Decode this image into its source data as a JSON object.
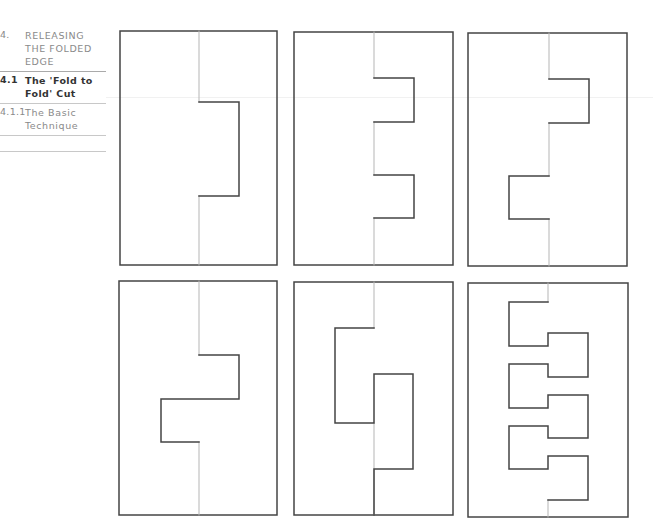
{
  "sidebar": {
    "items": [
      {
        "number": "4.",
        "label": "RELEASING THE FOLDED EDGE",
        "lines": [
          "RELEASING",
          "THE FOLDED",
          "EDGE"
        ],
        "active": false
      },
      {
        "number": "4.1",
        "label": "The 'Fold to Fold' Cut",
        "lines": [
          "The 'Fold to",
          "Fold' Cut"
        ],
        "active": true
      },
      {
        "number": "4.1.1",
        "label": "The Basic Technique",
        "lines": [
          "The Basic",
          "Technique"
        ],
        "active": false
      }
    ]
  },
  "figure": {
    "colors": {
      "border": "#444444",
      "fold": "#b5b5b5",
      "cut": "#444444"
    },
    "panels": [
      {
        "id": 1,
        "label": "single tab right"
      },
      {
        "id": 2,
        "label": "two tabs right"
      },
      {
        "id": 3,
        "label": "tab right, tab left"
      },
      {
        "id": 4,
        "label": "stepped tab right then left"
      },
      {
        "id": 5,
        "label": "interlocking tab left then right"
      },
      {
        "id": 6,
        "label": "alternating six tabs"
      }
    ]
  }
}
